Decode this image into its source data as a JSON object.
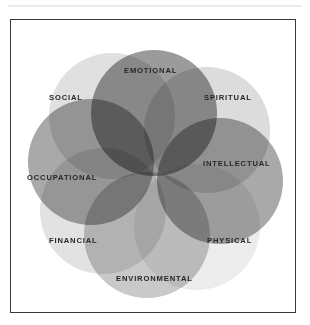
{
  "figure": {
    "type": "venn-wheel",
    "background_color": "#ffffff",
    "frame_border_color": "#3b3b3b",
    "rule_color": "#ebebeb",
    "label_color": "#25272b",
    "center_gap_color": "#ffffff"
  },
  "chart_data": {
    "type": "venn",
    "title": "",
    "subtitle": "",
    "xlabel": "",
    "ylabel": "",
    "legend_position": "none",
    "grid": false,
    "layout": "six-circle overlapping wheel around a white hexagonal center gap",
    "dimensions": [
      {
        "label": "EMOTIONAL",
        "position": "top",
        "color": "#9b9b9b",
        "circle": {
          "cx": 143,
          "cy": 93,
          "r": 63
        },
        "label_pos": {
          "x": 113,
          "y": 47
        }
      },
      {
        "label": "SPIRITUAL",
        "position": "upper-right",
        "color": "#dcdcdc",
        "circle": {
          "cx": 196,
          "cy": 110,
          "r": 63
        },
        "label_pos": {
          "x": 193,
          "y": 74
        }
      },
      {
        "label": "INTELLECTUAL",
        "position": "right",
        "color": "#a9a9a9",
        "circle": {
          "cx": 209,
          "cy": 161,
          "r": 63
        },
        "label_pos": {
          "x": 192,
          "y": 140
        }
      },
      {
        "label": "PHYSICAL",
        "position": "lower-right",
        "color": "#ececec",
        "circle": {
          "cx": 186,
          "cy": 207,
          "r": 63
        },
        "label_pos": {
          "x": 196,
          "y": 217
        }
      },
      {
        "label": "ENVIRONMENTAL",
        "position": "bottom",
        "color": "#c9c9c9",
        "circle": {
          "cx": 136,
          "cy": 215,
          "r": 63
        },
        "label_pos": {
          "x": 105,
          "y": 255
        }
      },
      {
        "label": "FINANCIAL",
        "position": "lower-left",
        "color": "#e2e2e2",
        "circle": {
          "cx": 92,
          "cy": 191,
          "r": 63
        },
        "label_pos": {
          "x": 38,
          "y": 217
        }
      },
      {
        "label": "OCCUPATIONAL",
        "position": "left",
        "color": "#a9a9a9",
        "circle": {
          "cx": 80,
          "cy": 142,
          "r": 63
        },
        "label_pos": {
          "x": 16,
          "y": 154
        }
      },
      {
        "label": "SOCIAL",
        "position": "upper-left",
        "color": "#e0e0e0",
        "circle": {
          "cx": 101,
          "cy": 96,
          "r": 63
        },
        "label_pos": {
          "x": 38,
          "y": 74
        }
      }
    ]
  }
}
